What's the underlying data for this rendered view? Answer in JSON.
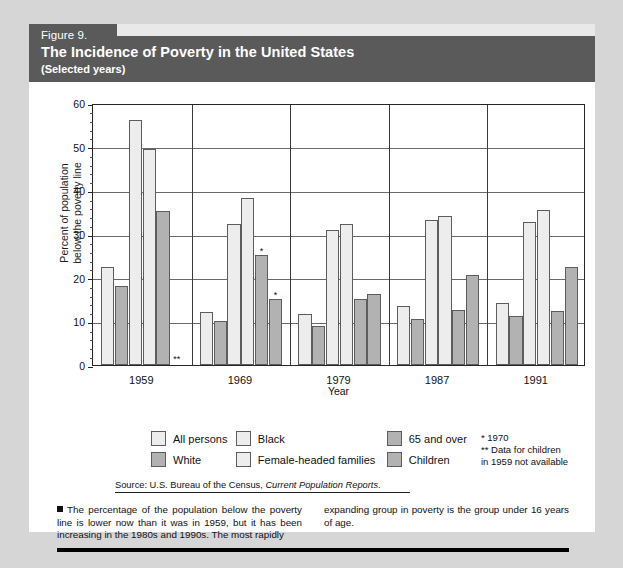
{
  "figure": {
    "number": "Figure 9.",
    "title": "The Incidence of Poverty in the United States",
    "subtitle": "(Selected years)"
  },
  "axes": {
    "y_title_line1": "Percent of population",
    "y_title_line2": "below the poverty line",
    "x_title": "Year"
  },
  "legend": {
    "items": [
      {
        "label": "All persons",
        "shade": "light"
      },
      {
        "label": "Black",
        "shade": "light"
      },
      {
        "label": "65 and over",
        "shade": "dark"
      },
      {
        "label": "White",
        "shade": "dark"
      },
      {
        "label": "Female-headed families",
        "shade": "light"
      },
      {
        "label": "Children",
        "shade": "dark"
      }
    ]
  },
  "footnotes": {
    "one": "*  1970",
    "two_line1": "** Data for children",
    "two_line2": "in 1959 not available"
  },
  "source": {
    "prefix": "Source: U.S. Bureau of the Census, ",
    "italic": "Current Population Reports",
    "suffix": "."
  },
  "caption": {
    "left": "The percentage of the population below the poverty line is lower now than it was in 1959, but it has been increasing in the 1980s and 1990s. The most rapidly",
    "right": "expanding group in poverty is the group under 16 years of age."
  },
  "colors": {
    "page_background": "#d6d6d6",
    "card_background": "#ffffff",
    "header_band": "#5a5a5a",
    "bar_light": "#ededed",
    "bar_dark": "#b2b2b2",
    "bar_border": "#5d5d5d",
    "axis": "#262626",
    "gridline": "#6a6a6a",
    "text": "#111111"
  },
  "chart_data": {
    "type": "bar",
    "title": "The Incidence of Poverty in the United States",
    "subtitle": "(Selected years)",
    "xlabel": "Year",
    "ylabel": "Percent of population below the poverty line",
    "ylim": [
      0,
      60
    ],
    "yticks": [
      0,
      10,
      20,
      30,
      40,
      50,
      60
    ],
    "ytick_labels": [
      "0",
      "10",
      "20",
      "30",
      "40",
      "50",
      "60"
    ],
    "grid": true,
    "legend_position": "below",
    "categories": [
      "1959",
      "1969",
      "1979",
      "1987",
      "1991"
    ],
    "series": [
      {
        "name": "All persons",
        "shade": "light",
        "values": [
          22.4,
          12.1,
          11.7,
          13.5,
          14.2
        ]
      },
      {
        "name": "White",
        "shade": "dark",
        "values": [
          18.1,
          10.0,
          9.0,
          10.5,
          11.3
        ]
      },
      {
        "name": "Black",
        "shade": "light",
        "values": [
          56.2,
          32.2,
          31.0,
          33.1,
          32.7
        ]
      },
      {
        "name": "Female-headed families",
        "shade": "light",
        "values": [
          49.4,
          38.2,
          32.3,
          34.2,
          35.6
        ]
      },
      {
        "name": "65 and over",
        "shade": "dark",
        "values": [
          35.2,
          25.3,
          15.2,
          12.5,
          12.4
        ]
      },
      {
        "name": "Children",
        "shade": "dark",
        "values": [
          null,
          15.1,
          16.2,
          20.6,
          22.5
        ]
      }
    ],
    "annotations": [
      {
        "category": "1959",
        "series": "Children",
        "marker": "**",
        "meaning": "Data for children in 1959 not available"
      },
      {
        "category": "1969",
        "series": "65 and over",
        "marker": "*",
        "meaning": "1970"
      },
      {
        "category": "1969",
        "series": "Children",
        "marker": "*",
        "meaning": "1970"
      }
    ],
    "source": "Source: U.S. Bureau of the Census, Current Population Reports."
  }
}
